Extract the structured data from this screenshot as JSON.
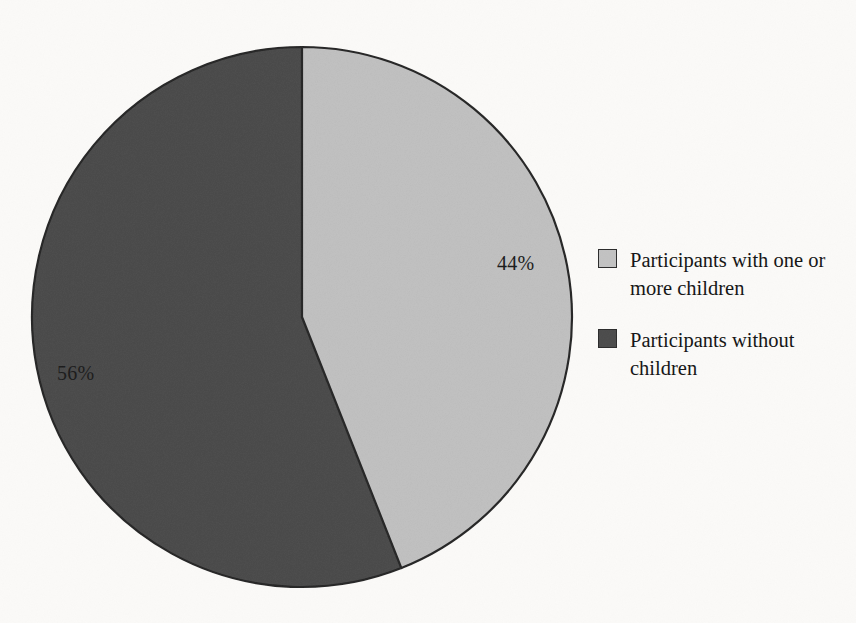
{
  "figure": {
    "kind": "pie-chart",
    "background_color": "#fbfaf8"
  },
  "chart_data": {
    "type": "pie",
    "title": "",
    "subtitle": "",
    "xlabel": "",
    "ylabel": "",
    "grid": false,
    "legend_position": "right",
    "start_angle_deg": 0,
    "direction": "clockwise",
    "units": "percent",
    "categories": [
      "Participants with one or more children",
      "Participants without children"
    ],
    "values": [
      44,
      56
    ],
    "labels": [
      "44%",
      "56%"
    ],
    "colors": [
      "#c2c2c2",
      "#4b4b4b"
    ],
    "slices": [
      {
        "name": "Participants with one or more children",
        "value": 44,
        "label": "44%",
        "color": "#c2c2c2",
        "start_angle_deg": 0,
        "end_angle_deg": 158.4
      },
      {
        "name": "Participants without children",
        "value": 56,
        "label": "56%",
        "color": "#4b4b4b",
        "start_angle_deg": 158.4,
        "end_angle_deg": 360
      }
    ],
    "geometry": {
      "center_x": 302,
      "center_y": 317,
      "radius": 270,
      "outline_color": "#262626"
    }
  },
  "legend": {
    "items": [
      {
        "label": "Participants with one or more children",
        "color": "#c2c2c2",
        "swatch_name": "legend-swatch-light"
      },
      {
        "label": "Participants without children",
        "color": "#4b4b4b",
        "swatch_name": "legend-swatch-dark"
      }
    ]
  }
}
